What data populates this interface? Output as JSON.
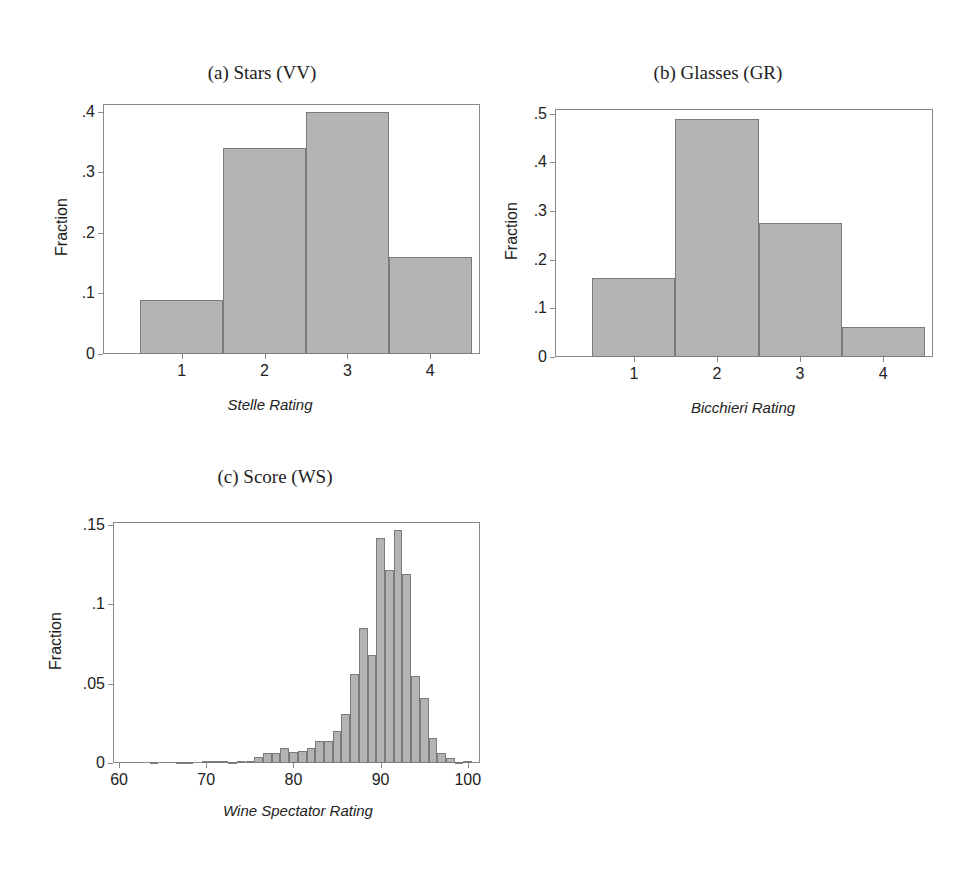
{
  "chart_data": [
    {
      "id": "a",
      "type": "bar",
      "title": "(a) Stars (VV)",
      "xlabel": "Stelle Rating",
      "ylabel": "Fraction",
      "categories": [
        "1",
        "2",
        "3",
        "4"
      ],
      "values": [
        0.09,
        0.34,
        0.4,
        0.16
      ],
      "yticks": [
        "0",
        ".1",
        ".2",
        ".3",
        ".4"
      ],
      "ytick_values": [
        0,
        0.1,
        0.2,
        0.3,
        0.4
      ],
      "ylim": [
        0,
        0.413
      ],
      "xlim": [
        0.05,
        4.6
      ],
      "grid": false,
      "legend": null,
      "bar_color": "#b3b3b3"
    },
    {
      "id": "b",
      "type": "bar",
      "title": "(b) Glasses (GR)",
      "xlabel": "Bicchieri Rating",
      "ylabel": "Fraction",
      "categories": [
        "1",
        "2",
        "3",
        "4"
      ],
      "values": [
        0.163,
        0.49,
        0.275,
        0.062
      ],
      "yticks": [
        "0",
        ".1",
        ".2",
        ".3",
        ".4",
        ".5"
      ],
      "ytick_values": [
        0,
        0.1,
        0.2,
        0.3,
        0.4,
        0.5
      ],
      "ylim": [
        0,
        0.51
      ],
      "xlim": [
        0.05,
        4.6
      ],
      "grid": false,
      "legend": null,
      "bar_color": "#b3b3b3"
    },
    {
      "id": "c",
      "type": "bar",
      "title": "(c) Score (WS)",
      "xlabel": "Wine Spectator Rating",
      "ylabel": "Fraction",
      "x": [
        63,
        64,
        65,
        66,
        67,
        68,
        69,
        70,
        71,
        72,
        73,
        74,
        75,
        76,
        77,
        78,
        79,
        80,
        81,
        82,
        83,
        84,
        85,
        86,
        87,
        88,
        89,
        90,
        91,
        92,
        93,
        94,
        95,
        96,
        97,
        98,
        99,
        100
      ],
      "values": [
        0.0003,
        0.0005,
        0.0003,
        0.0003,
        0.0005,
        0.0005,
        0.0003,
        0.001,
        0.001,
        0.001,
        0.0005,
        0.001,
        0.001,
        0.004,
        0.0065,
        0.006,
        0.0095,
        0.007,
        0.0075,
        0.0095,
        0.014,
        0.014,
        0.02,
        0.031,
        0.056,
        0.085,
        0.068,
        0.142,
        0.122,
        0.147,
        0.119,
        0.055,
        0.041,
        0.016,
        0.006,
        0.003,
        0.0005,
        0.001
      ],
      "xticks": [
        "60",
        "70",
        "80",
        "90",
        "100"
      ],
      "xtick_values": [
        60,
        70,
        80,
        90,
        100
      ],
      "yticks": [
        "0",
        ".05",
        ".1",
        ".15"
      ],
      "ytick_values": [
        0,
        0.05,
        0.1,
        0.15
      ],
      "ylim": [
        0,
        0.152
      ],
      "xlim": [
        59.3,
        101.4
      ],
      "grid": false,
      "legend": null,
      "bar_color": "#b3b3b3"
    }
  ],
  "panels": {
    "a": {
      "title": "(a) Stars (VV)",
      "xlabel": "Stelle Rating",
      "ylabel": "Fraction"
    },
    "b": {
      "title": "(b) Glasses (GR)",
      "xlabel": "Bicchieri Rating",
      "ylabel": "Fraction"
    },
    "c": {
      "title": "(c) Score (WS)",
      "xlabel": "Wine Spectator Rating",
      "ylabel": "Fraction"
    }
  }
}
